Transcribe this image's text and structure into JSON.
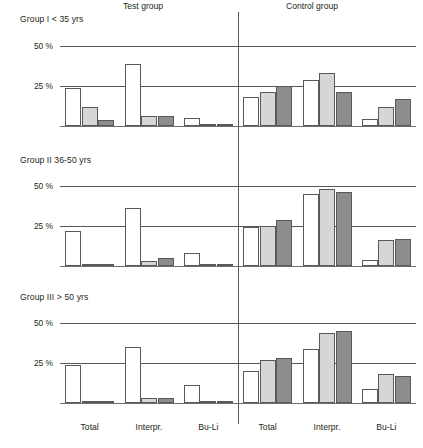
{
  "figure": {
    "side_titles": [
      {
        "label": "Test group",
        "x": 135
      },
      {
        "label": "Control group",
        "x": 318
      }
    ],
    "divider_label": "panel-divider"
  },
  "chart_data": {
    "type": "bar",
    "title": "",
    "xlabel": "",
    "ylabel": "",
    "ylim": [
      0,
      55
    ],
    "grid": true,
    "yticks": [
      25,
      50
    ],
    "ytick_labels": [
      "25 %",
      "50 %"
    ],
    "legend_position": "none",
    "series": [
      {
        "name": "Series 1",
        "color": "#ffffff"
      },
      {
        "name": "Series 2",
        "color": "#d6d6d6"
      },
      {
        "name": "Series 3",
        "color": "#8d8d8d"
      }
    ],
    "group_headers": [
      "Test group",
      "Control group"
    ],
    "categories": [
      "Total",
      "Interpr.",
      "Bu-Li",
      "Total",
      "Interpr.",
      "Bu-Li"
    ],
    "panels": [
      {
        "title": "Group I < 35 yrs",
        "groups": [
          {
            "group": "Test group",
            "category": "Total",
            "values": [
              24,
              12,
              4
            ]
          },
          {
            "group": "Test group",
            "category": "Interpr.",
            "values": [
              39,
              6,
              6.5
            ]
          },
          {
            "group": "Test group",
            "category": "Bu-Li",
            "values": [
              5,
              1.5,
              1.5
            ]
          },
          {
            "group": "Control group",
            "category": "Total",
            "values": [
              18,
              21,
              25
            ]
          },
          {
            "group": "Control group",
            "category": "Interpr.",
            "values": [
              29,
              33,
              21
            ]
          },
          {
            "group": "Control group",
            "category": "Bu-Li",
            "values": [
              4.5,
              12,
              17
            ]
          }
        ]
      },
      {
        "title": "Group II 36-50 yrs",
        "groups": [
          {
            "group": "Test group",
            "category": "Total",
            "values": [
              22,
              1.5,
              1.5
            ]
          },
          {
            "group": "Test group",
            "category": "Interpr.",
            "values": [
              36,
              3,
              5
            ]
          },
          {
            "group": "Test group",
            "category": "Bu-Li",
            "values": [
              8,
              1.5,
              1.5
            ]
          },
          {
            "group": "Control group",
            "category": "Total",
            "values": [
              24.5,
              25,
              29
            ]
          },
          {
            "group": "Control group",
            "category": "Interpr.",
            "values": [
              45,
              48,
              46
            ]
          },
          {
            "group": "Control group",
            "category": "Bu-Li",
            "values": [
              4,
              16,
              17
            ]
          }
        ]
      },
      {
        "title": "Group III > 50 yrs",
        "groups": [
          {
            "group": "Test group",
            "category": "Total",
            "values": [
              24,
              1.5,
              1.5
            ]
          },
          {
            "group": "Test group",
            "category": "Interpr.",
            "values": [
              35,
              3,
              3
            ]
          },
          {
            "group": "Test group",
            "category": "Bu-Li",
            "values": [
              11,
              1,
              1
            ]
          },
          {
            "group": "Control group",
            "category": "Total",
            "values": [
              20,
              27,
              28
            ]
          },
          {
            "group": "Control group",
            "category": "Interpr.",
            "values": [
              34,
              44,
              45
            ]
          },
          {
            "group": "Control group",
            "category": "Bu-Li",
            "values": [
              9,
              18,
              17
            ]
          }
        ]
      }
    ]
  }
}
